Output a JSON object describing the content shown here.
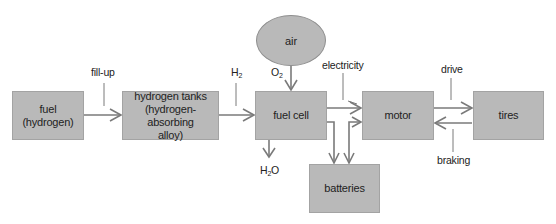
{
  "nodes": {
    "fuel": {
      "line1": "fuel",
      "line2": "(hydrogen)"
    },
    "tanks": {
      "line1": "hydrogen tanks",
      "line2": "(hydrogen-absorbing",
      "line3": "alloy)"
    },
    "fuel_cell": {
      "label": "fuel cell"
    },
    "air": {
      "label": "air"
    },
    "motor": {
      "label": "motor"
    },
    "tires": {
      "label": "tires"
    },
    "batteries": {
      "label": "batteries"
    }
  },
  "edge_labels": {
    "fill_up": "fill-up",
    "h2": {
      "base": "H",
      "sub": "2"
    },
    "o2": {
      "base": "O",
      "sub": "2"
    },
    "electricity": "electricity",
    "h2o": {
      "base": "H",
      "sub": "2",
      "tail": "O"
    },
    "drive": "drive",
    "braking": "braking"
  },
  "colors": {
    "box_fill": "#b9b9b9",
    "line": "#7a7a7a"
  }
}
